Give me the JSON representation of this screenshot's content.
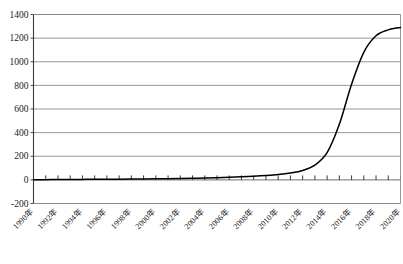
{
  "chart_data": {
    "type": "line",
    "title": "",
    "subtitle": "",
    "xlabel": "",
    "ylabel": "",
    "xlim": [
      1990,
      2020
    ],
    "ylim": [
      -200,
      1400
    ],
    "ytick_step": 200,
    "xtick_step": 1,
    "xlabel_step": 2,
    "grid": true,
    "grid_axis": "y",
    "legend": false,
    "legend_position": "none",
    "line_color": "#000000",
    "grid_color": "#8c8c8c",
    "axis_color": "#3a3a3a",
    "background_color": "#ffffff",
    "yticks": [
      1400,
      1200,
      1000,
      800,
      600,
      400,
      200,
      0,
      -200
    ],
    "ytick_labels": [
      "1400",
      "1200",
      "1000",
      "800",
      "600",
      "400",
      "200",
      "0",
      "-200"
    ],
    "xticks": [
      1990,
      1991,
      1992,
      1993,
      1994,
      1995,
      1996,
      1997,
      1998,
      1999,
      2000,
      2001,
      2002,
      2003,
      2004,
      2005,
      2006,
      2007,
      2008,
      2009,
      2010,
      2011,
      2012,
      2013,
      2014,
      2015,
      2016,
      2017,
      2018,
      2019,
      2020
    ],
    "xtick_labels": [
      "1990年",
      "1992年",
      "1994年",
      "1996年",
      "1998年",
      "2000年",
      "2002年",
      "2004年",
      "2006年",
      "2008年",
      "2010年",
      "2012年",
      "2014年",
      "2016年",
      "2018年",
      "2020年"
    ],
    "xtick_label_years": [
      1990,
      1992,
      1994,
      1996,
      1998,
      2000,
      2002,
      2004,
      2006,
      2008,
      2010,
      2012,
      2014,
      2016,
      2018,
      2020
    ],
    "x": [
      1990,
      1991,
      1992,
      1993,
      1994,
      1995,
      1996,
      1997,
      1998,
      1999,
      2000,
      2001,
      2002,
      2003,
      2004,
      2005,
      2006,
      2007,
      2008,
      2009,
      2010,
      2011,
      2012,
      2013,
      2014,
      2015,
      2016,
      2017,
      2018,
      2019,
      2020
    ],
    "values": [
      2,
      2,
      3,
      3,
      4,
      5,
      5,
      6,
      7,
      8,
      9,
      10,
      12,
      14,
      16,
      19,
      22,
      26,
      31,
      37,
      45,
      58,
      80,
      125,
      230,
      470,
      810,
      1080,
      1220,
      1270,
      1290
    ],
    "series": [
      {
        "name": "",
        "color": "#000000",
        "values": [
          2,
          2,
          3,
          3,
          4,
          5,
          5,
          6,
          7,
          8,
          9,
          10,
          12,
          14,
          16,
          19,
          22,
          26,
          31,
          37,
          45,
          58,
          80,
          125,
          230,
          470,
          810,
          1080,
          1220,
          1270,
          1290
        ]
      }
    ]
  }
}
